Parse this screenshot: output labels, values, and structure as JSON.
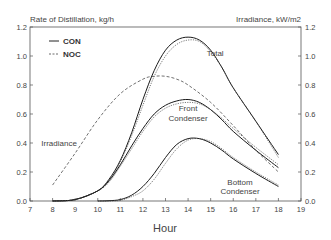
{
  "chart_data": {
    "type": "line",
    "title": "",
    "ylabel_left": "Rate of Distillation, kg/h",
    "ylabel_right": "Irradiance, kW/m2",
    "xlabel": "Hour",
    "xlim": [
      7,
      19
    ],
    "ylim_left": [
      0.0,
      1.2
    ],
    "ylim_right": [
      0.0,
      1.2
    ],
    "x_ticks": [
      "7",
      "8",
      "9",
      "10",
      "11",
      "12",
      "13",
      "14",
      "15",
      "16",
      "17",
      "18",
      "19"
    ],
    "y_ticks_left": [
      "0.0",
      "0.2",
      "0.4",
      "0.6",
      "0.8",
      "1.0",
      "1.2"
    ],
    "y_ticks_right": [
      "0.0",
      "0.2",
      "0.4",
      "0.6",
      "0.8",
      "1.0",
      "1.2"
    ],
    "grid": false,
    "legend": {
      "position": "upper-left",
      "entries": [
        {
          "label": "CON",
          "style": "solid"
        },
        {
          "label": "NOC",
          "style": "dotted"
        }
      ]
    },
    "annotations": [
      {
        "text": "Total",
        "x": 15.2,
        "y": 1.0
      },
      {
        "text": "Front",
        "x": 14.0,
        "y": 0.62
      },
      {
        "text": "Condenser",
        "x": 14.0,
        "y": 0.555
      },
      {
        "text": "Irradiance",
        "x": 7.5,
        "y": 0.38
      },
      {
        "text": "Bottom",
        "x": 16.3,
        "y": 0.11
      },
      {
        "text": "Condenser",
        "x": 16.3,
        "y": 0.045
      }
    ],
    "series": [
      {
        "name": "Total (CON)",
        "style": "solid",
        "x": [
          8,
          9,
          10,
          10.5,
          11,
          11.5,
          12,
          12.5,
          13,
          13.5,
          14,
          14.5,
          15,
          15.5,
          16,
          17,
          18
        ],
        "values": [
          0.0,
          0.01,
          0.07,
          0.15,
          0.28,
          0.47,
          0.7,
          0.9,
          1.04,
          1.11,
          1.13,
          1.11,
          1.04,
          0.92,
          0.78,
          0.55,
          0.32
        ]
      },
      {
        "name": "Total (NOC)",
        "style": "dotted",
        "x": [
          8,
          9,
          10,
          10.5,
          11,
          11.5,
          12,
          12.5,
          13,
          13.5,
          14,
          14.5,
          15,
          15.5,
          16,
          17,
          18
        ],
        "values": [
          0.0,
          0.01,
          0.07,
          0.14,
          0.27,
          0.45,
          0.66,
          0.86,
          1.0,
          1.08,
          1.11,
          1.1,
          1.03,
          0.92,
          0.78,
          0.55,
          0.3
        ]
      },
      {
        "name": "Front Condenser (CON)",
        "style": "solid",
        "x": [
          8,
          9,
          10,
          10.5,
          11,
          11.5,
          12,
          12.5,
          13,
          13.5,
          14,
          14.5,
          15,
          15.5,
          16,
          17,
          18
        ],
        "values": [
          0.0,
          0.01,
          0.07,
          0.14,
          0.25,
          0.38,
          0.5,
          0.6,
          0.66,
          0.69,
          0.7,
          0.68,
          0.63,
          0.56,
          0.48,
          0.35,
          0.23
        ]
      },
      {
        "name": "Front Condenser (NOC)",
        "style": "dotted",
        "x": [
          8,
          9,
          10,
          10.5,
          11,
          11.5,
          12,
          12.5,
          13,
          13.5,
          14,
          14.5,
          15,
          15.5,
          16,
          17,
          18
        ],
        "values": [
          0.0,
          0.01,
          0.07,
          0.13,
          0.24,
          0.36,
          0.48,
          0.58,
          0.64,
          0.67,
          0.68,
          0.67,
          0.63,
          0.57,
          0.5,
          0.37,
          0.25
        ]
      },
      {
        "name": "Bottom Condenser (CON)",
        "style": "solid",
        "x": [
          10,
          10.5,
          11,
          11.5,
          12,
          12.5,
          13,
          13.5,
          14,
          14.5,
          15,
          15.5,
          16,
          17,
          18
        ],
        "values": [
          0.0,
          0.002,
          0.01,
          0.04,
          0.1,
          0.19,
          0.3,
          0.39,
          0.43,
          0.43,
          0.4,
          0.35,
          0.29,
          0.19,
          0.1
        ]
      },
      {
        "name": "Bottom Condenser (NOC)",
        "style": "dotted",
        "x": [
          10,
          10.5,
          11,
          11.5,
          12,
          12.5,
          13,
          13.5,
          14,
          14.5,
          15,
          15.5,
          16,
          17,
          18
        ],
        "values": [
          0.0,
          0.0,
          0.005,
          0.03,
          0.07,
          0.15,
          0.26,
          0.36,
          0.42,
          0.43,
          0.41,
          0.36,
          0.3,
          0.2,
          0.11
        ]
      },
      {
        "name": "Irradiance",
        "style": "dashed",
        "axis": "right",
        "x": [
          8,
          9,
          10,
          11,
          12,
          12.5,
          13,
          13.5,
          14,
          15,
          16,
          17,
          18
        ],
        "values": [
          0.11,
          0.33,
          0.56,
          0.74,
          0.84,
          0.86,
          0.86,
          0.84,
          0.8,
          0.68,
          0.52,
          0.35,
          0.2
        ]
      }
    ]
  }
}
